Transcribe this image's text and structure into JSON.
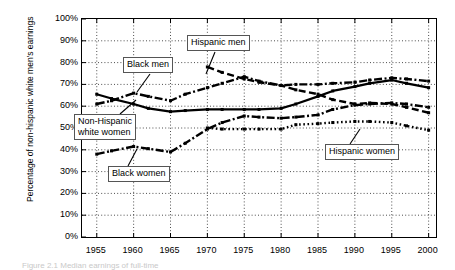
{
  "figure": {
    "ylabel": "Percentage of non-hispanic\nwhite men's earnings",
    "caption": "Figure 2.1  Median earnings of full-time"
  },
  "chart_data": {
    "type": "line",
    "title": "",
    "xlabel": "",
    "ylabel": "Percentage of non-hispanic white men's earnings",
    "xlim": [
      1953,
      2001
    ],
    "ylim": [
      0,
      100
    ],
    "grid": true,
    "legend_position": "inline-callouts",
    "xticks": [
      1955,
      1960,
      1965,
      1970,
      1975,
      1980,
      1985,
      1990,
      1995,
      2000
    ],
    "xtick_labels": [
      "1955",
      "1960",
      "1965",
      "1970",
      "1975",
      "1980",
      "1985",
      "1990",
      "1995",
      "2000"
    ],
    "yticks": [
      0,
      10,
      20,
      30,
      40,
      50,
      60,
      70,
      80,
      90,
      100
    ],
    "ytick_labels": [
      "0%",
      "10%",
      "20%",
      "30%",
      "40%",
      "50%",
      "60%",
      "70%",
      "80%",
      "90%",
      "100%"
    ],
    "series": [
      {
        "name": "Black men",
        "style": "dash-dot",
        "x": [
          1955,
          1957,
          1960,
          1962,
          1965,
          1967,
          1970,
          1972,
          1975,
          1977,
          1980,
          1982,
          1985,
          1987,
          1990,
          1992,
          1995,
          1997,
          2000
        ],
        "values": [
          61.0,
          62.5,
          66.0,
          64.5,
          62.5,
          65.5,
          68.5,
          70.5,
          73.5,
          71.5,
          69.5,
          70.0,
          70.0,
          70.5,
          71.0,
          72.0,
          73.0,
          72.5,
          71.5
        ]
      },
      {
        "name": "Hispanic men",
        "style": "dashed",
        "x": [
          1970,
          1972,
          1975,
          1977,
          1980,
          1982,
          1985,
          1987,
          1990,
          1992,
          1995,
          1997,
          2000
        ],
        "values": [
          78.0,
          75.5,
          72.5,
          71.0,
          69.5,
          67.5,
          65.5,
          63.0,
          61.0,
          61.5,
          61.0,
          59.5,
          57.0
        ]
      },
      {
        "name": "Non-Hispanic white women",
        "style": "solid",
        "x": [
          1955,
          1957,
          1960,
          1962,
          1965,
          1967,
          1970,
          1972,
          1975,
          1977,
          1980,
          1982,
          1985,
          1987,
          1990,
          1992,
          1995,
          1997,
          2000
        ],
        "values": [
          65.5,
          63.5,
          61.0,
          59.0,
          57.5,
          58.0,
          58.5,
          58.5,
          58.5,
          58.5,
          59.0,
          61.0,
          64.5,
          67.0,
          69.0,
          70.5,
          72.0,
          70.5,
          68.5
        ]
      },
      {
        "name": "Black women",
        "style": "dash-dot",
        "x": [
          1955,
          1957,
          1960,
          1962,
          1965,
          1967,
          1970,
          1972,
          1975,
          1977,
          1980,
          1982,
          1985,
          1987,
          1990,
          1992,
          1995,
          1997,
          2000
        ],
        "values": [
          38.0,
          39.5,
          41.5,
          40.5,
          39.0,
          43.0,
          49.5,
          52.5,
          55.5,
          55.0,
          54.5,
          55.0,
          56.0,
          58.5,
          60.5,
          61.0,
          61.5,
          61.0,
          59.5
        ]
      },
      {
        "name": "Hispanic women",
        "style": "dotted",
        "x": [
          1970,
          1972,
          1975,
          1977,
          1980,
          1982,
          1985,
          1987,
          1990,
          1992,
          1995,
          1997,
          2000
        ],
        "values": [
          50.0,
          49.5,
          49.5,
          49.5,
          49.5,
          51.5,
          52.0,
          52.5,
          53.0,
          53.0,
          52.5,
          51.0,
          49.0
        ]
      }
    ],
    "annotations": [
      {
        "text": "Hispanic men",
        "target_series": "Hispanic men"
      },
      {
        "text": "Black men",
        "target_series": "Black men"
      },
      {
        "text": "Non-Hispanic\nwhite women",
        "target_series": "Non-Hispanic white women"
      },
      {
        "text": "Black women",
        "target_series": "Black women"
      },
      {
        "text": "Hispanic women",
        "target_series": "Hispanic women"
      }
    ]
  }
}
